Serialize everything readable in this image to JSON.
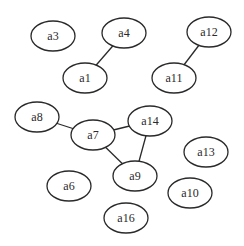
{
  "graph": {
    "type": "undirected",
    "node_style": {
      "shape": "ellipse",
      "rx": 22,
      "ry": 15,
      "stroke": "#2a2a2a",
      "fill": "#ffffff"
    },
    "nodes": [
      {
        "id": "a3",
        "label": "a3",
        "x": 53,
        "y": 36
      },
      {
        "id": "a4",
        "label": "a4",
        "x": 124,
        "y": 33
      },
      {
        "id": "a1",
        "label": "a1",
        "x": 85,
        "y": 78
      },
      {
        "id": "a12",
        "label": "a12",
        "x": 209,
        "y": 32
      },
      {
        "id": "a11",
        "label": "a11",
        "x": 174,
        "y": 78
      },
      {
        "id": "a8",
        "label": "a8",
        "x": 37,
        "y": 117
      },
      {
        "id": "a7",
        "label": "a7",
        "x": 93,
        "y": 135
      },
      {
        "id": "a14",
        "label": "a14",
        "x": 150,
        "y": 121
      },
      {
        "id": "a9",
        "label": "a9",
        "x": 135,
        "y": 176
      },
      {
        "id": "a6",
        "label": "a6",
        "x": 69,
        "y": 186
      },
      {
        "id": "a13",
        "label": "a13",
        "x": 206,
        "y": 152
      },
      {
        "id": "a10",
        "label": "a10",
        "x": 190,
        "y": 193
      },
      {
        "id": "a16",
        "label": "a16",
        "x": 126,
        "y": 218
      }
    ],
    "edges": [
      {
        "from": "a4",
        "to": "a1"
      },
      {
        "from": "a12",
        "to": "a11"
      },
      {
        "from": "a8",
        "to": "a7"
      },
      {
        "from": "a7",
        "to": "a14"
      },
      {
        "from": "a7",
        "to": "a9"
      },
      {
        "from": "a14",
        "to": "a9"
      }
    ]
  }
}
